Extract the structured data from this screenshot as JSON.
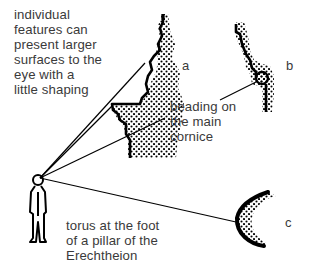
{
  "figure": {
    "labels": {
      "individual_features": "individual\nfeatures can\npresent larger\nsurfaces to the\neye with a\nlittle shaping",
      "beading": "beading on\nthe main\ncornice",
      "torus": "torus at the foot\nof a pillar of the\nErechtheion"
    },
    "profile_letters": {
      "a": "a",
      "b": "b",
      "c": "c"
    },
    "elements": [
      {
        "id": "viewer",
        "description": "standing human figure (observer)"
      },
      {
        "id": "profile-a",
        "description": "cornice moulding profile with stippled section"
      },
      {
        "id": "profile-b",
        "description": "beading moulding profile with stippled section"
      },
      {
        "id": "profile-c",
        "description": "torus profile with stippled section"
      }
    ],
    "colors": {
      "ink": "#000000",
      "text": "#3a3a3a",
      "background": "#ffffff"
    }
  }
}
